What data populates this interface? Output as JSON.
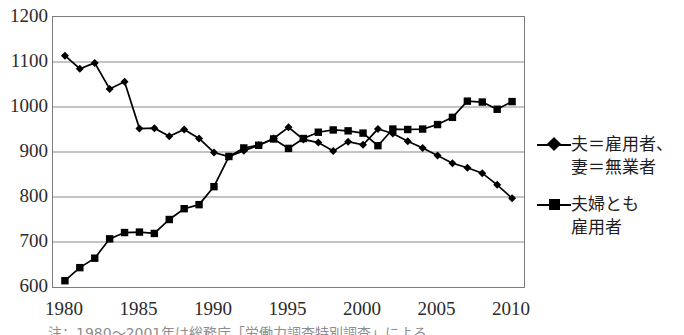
{
  "figure": {
    "top_cut_text": "",
    "note_text": "注：1980〜2001年は総務庁「労働力調査特別調査」による"
  },
  "chart_data": {
    "type": "line",
    "title": "",
    "subtitle": "",
    "xlabel": "",
    "ylabel": "",
    "xlim": [
      1979.2,
      2010.8
    ],
    "ylim": [
      600,
      1200
    ],
    "ytick_step": 100,
    "grid": true,
    "grid_axis": "y",
    "legend_position": "right",
    "units_note": "万世帯",
    "x": [
      1980,
      1981,
      1982,
      1983,
      1984,
      1985,
      1986,
      1987,
      1988,
      1989,
      1990,
      1991,
      1992,
      1993,
      1994,
      1995,
      1996,
      1997,
      1998,
      1999,
      2000,
      2001,
      2002,
      2003,
      2004,
      2005,
      2006,
      2007,
      2008,
      2009,
      2010
    ],
    "yticks": [
      600,
      700,
      800,
      900,
      1000,
      1100,
      1200
    ],
    "xticks": [
      1980,
      1985,
      1990,
      1995,
      2000,
      2005,
      2010
    ],
    "series": [
      {
        "name": "夫＝雇用者、妻＝無業者",
        "name_lines": [
          "夫＝雇用者、",
          "妻＝無業者"
        ],
        "marker": "diamond",
        "color": "#000000",
        "values": [
          1114,
          1085,
          1098,
          1040,
          1056,
          952,
          953,
          935,
          950,
          930,
          899,
          890,
          903,
          915,
          930,
          955,
          928,
          921,
          902,
          923,
          916,
          951,
          941,
          924,
          909,
          892,
          875,
          865,
          853,
          827,
          797
        ]
      },
      {
        "name": "夫婦とも雇用者",
        "name_lines": [
          "夫婦とも",
          "雇用者"
        ],
        "marker": "square",
        "color": "#000000",
        "values": [
          614,
          643,
          664,
          707,
          721,
          722,
          719,
          750,
          774,
          783,
          823,
          890,
          909,
          915,
          929,
          908,
          930,
          944,
          949,
          947,
          942,
          914,
          951,
          950,
          951,
          961,
          977,
          1013,
          1011,
          995,
          1012
        ]
      }
    ]
  }
}
